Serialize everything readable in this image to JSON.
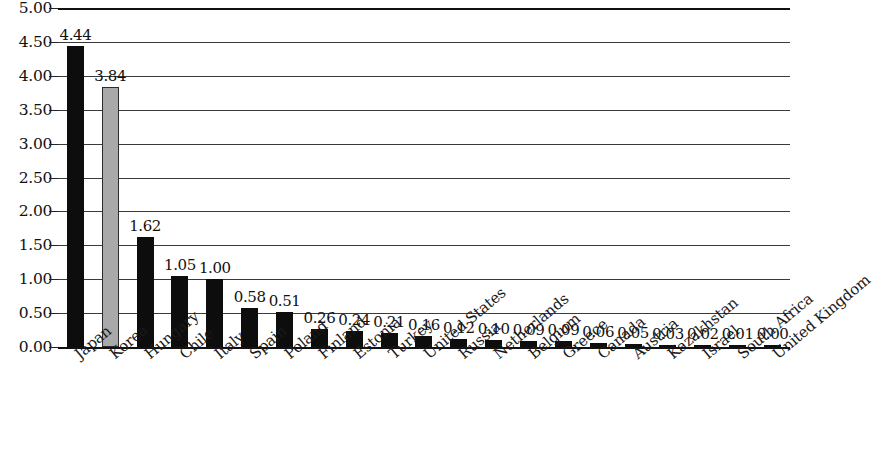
{
  "chart_data": {
    "type": "bar",
    "title": "",
    "subtitle": "",
    "xlabel": "",
    "ylabel": "",
    "ylim": [
      0.0,
      5.0
    ],
    "ytick_step": 0.5,
    "grid": true,
    "legend": false,
    "legend_position": "none",
    "ytick_labels": [
      "5.00",
      "4.50",
      "4.00",
      "3.50",
      "3.00",
      "2.50",
      "2.00",
      "1.50",
      "1.00",
      "0.50",
      "0.00"
    ],
    "ytick_values": [
      5.0,
      4.5,
      4.0,
      3.5,
      3.0,
      2.5,
      2.0,
      1.5,
      1.0,
      0.5,
      0.0
    ],
    "categories": [
      "Japan",
      "Korea",
      "Hungary",
      "Chile",
      "Italy",
      "Spain",
      "Poland",
      "Finland",
      "Estonia",
      "Turkey",
      "United States",
      "Russia",
      "Netherlands",
      "Belgium",
      "Greece",
      "Canada",
      "Austria",
      "Kazakhstan",
      "Israel",
      "South Africa",
      "United Kingdom"
    ],
    "values": [
      4.44,
      3.84,
      1.62,
      1.05,
      1.0,
      0.58,
      0.51,
      0.26,
      0.24,
      0.21,
      0.16,
      0.12,
      0.1,
      0.09,
      0.09,
      0.06,
      0.05,
      0.03,
      0.02,
      0.01,
      0.0
    ],
    "value_labels": [
      "4.44",
      "3.84",
      "1.62",
      "1.05",
      "1.00",
      "0.58",
      "0.51",
      "0.26",
      "0.24",
      "0.21",
      "0.16",
      "0.12",
      "0.10",
      "0.09",
      "0.09",
      "0.06",
      "0.05",
      "0.03",
      "0.02",
      "0.01",
      "0.00"
    ],
    "bar_colors": [
      "#0d0d0d",
      "#a9a9a9",
      "#0d0d0d",
      "#0d0d0d",
      "#0d0d0d",
      "#0d0d0d",
      "#0d0d0d",
      "#0d0d0d",
      "#0d0d0d",
      "#0d0d0d",
      "#0d0d0d",
      "#0d0d0d",
      "#0d0d0d",
      "#0d0d0d",
      "#0d0d0d",
      "#0d0d0d",
      "#0d0d0d",
      "#0d0d0d",
      "#0d0d0d",
      "#0d0d0d",
      "#0d0d0d"
    ],
    "highlight_category": "Korea",
    "colors": {
      "bar_default": "#0d0d0d",
      "bar_highlight": "#a9a9a9",
      "gridline": "#3a3a3a",
      "axis": "#111111",
      "text": "#111111",
      "background": "#ffffff"
    }
  }
}
